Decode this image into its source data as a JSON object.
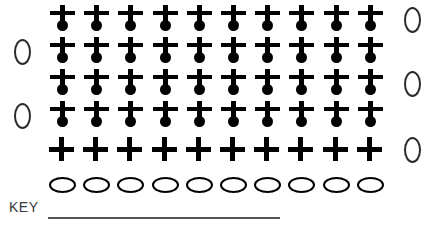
{
  "worksheet": {
    "columns": 10,
    "rows": 6,
    "symbols": {
      "plus_dot": "plus-with-dot",
      "plus": "plus",
      "ellipse": "horizontal-ellipse",
      "oval": "vertical-oval"
    },
    "grid_rows": [
      {
        "index": 1,
        "symbol": "plus-with-dot",
        "count": 10,
        "left_marker": "",
        "right_marker": "0"
      },
      {
        "index": 2,
        "symbol": "plus-with-dot",
        "count": 10,
        "left_marker": "0",
        "right_marker": ""
      },
      {
        "index": 3,
        "symbol": "plus-with-dot",
        "count": 10,
        "left_marker": "",
        "right_marker": "0"
      },
      {
        "index": 4,
        "symbol": "plus-with-dot",
        "count": 10,
        "left_marker": "0",
        "right_marker": ""
      },
      {
        "index": 5,
        "symbol": "plus",
        "count": 10,
        "left_marker": "",
        "right_marker": "0"
      },
      {
        "index": 6,
        "symbol": "horizontal-ellipse",
        "count": 10,
        "left_marker": "",
        "right_marker": ""
      }
    ],
    "key": {
      "label": "KEY",
      "answer": ""
    }
  },
  "colors": {
    "ink": "#000000",
    "marker": "#2a2a2a",
    "rule": "#555555",
    "text": "#3a3a3a",
    "background": "#ffffff"
  }
}
